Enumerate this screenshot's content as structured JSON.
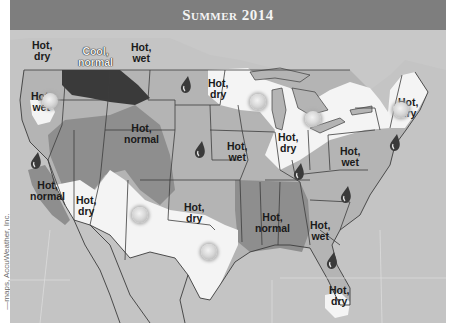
{
  "title": "Summer 2014",
  "credit": "—maps, AccuWeather, Inc.",
  "colors": {
    "background": "#c4c4c4",
    "title_bar": "#7e7e7e",
    "hot_dry": "#f4f4f4",
    "hot_wet": "#b4b4b4",
    "hot_normal": "#8e8e8e",
    "cool_normal": "#3a3a3a",
    "state_lines": "#3c3c3c"
  },
  "regions": [
    {
      "label": "Hot,\ndry",
      "area": "Pacific Northwest coast"
    },
    {
      "label": "Cool,\nnormal",
      "area": "Northern Rockies"
    },
    {
      "label": "Hot,\nwet",
      "area": "Northern Plains"
    },
    {
      "label": "Hot,\ndry",
      "area": "Upper Midwest"
    },
    {
      "label": "Hot,\nwet",
      "area": "Oregon"
    },
    {
      "label": "Hot,\nnormal",
      "area": "Central Rockies"
    },
    {
      "label": "Hot,\nwet",
      "area": "Central Plains"
    },
    {
      "label": "Hot,\ndry",
      "area": "Great Lakes"
    },
    {
      "label": "Hot,\ndry",
      "area": "New England"
    },
    {
      "label": "Hot,\nwet",
      "area": "Mid-Atlantic"
    },
    {
      "label": "Hot,\nnormal",
      "area": "California coast"
    },
    {
      "label": "Hot,\ndry",
      "area": "Southwest"
    },
    {
      "label": "Hot,\ndry",
      "area": "Southern Plains"
    },
    {
      "label": "Hot,\nnormal",
      "area": "Lower Mississippi Valley"
    },
    {
      "label": "Hot,\nwet",
      "area": "Southeast"
    },
    {
      "label": "Hot,\ndry",
      "area": "South Florida"
    }
  ],
  "icons": {
    "sun": "sun-icon",
    "raindrop": "raindrop-icon"
  }
}
